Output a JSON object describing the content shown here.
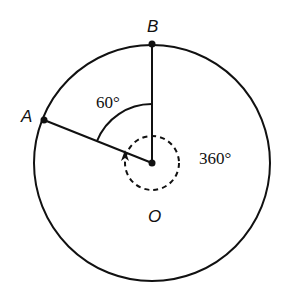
{
  "diagram": {
    "points": {
      "A": "A",
      "B": "B",
      "O": "O"
    },
    "angles": {
      "small": "60°",
      "full": "360°"
    },
    "colors": {
      "stroke": "#111111",
      "background": "#ffffff"
    }
  }
}
